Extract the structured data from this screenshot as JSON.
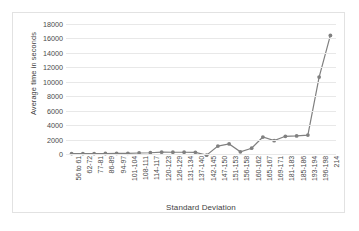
{
  "chart_data": {
    "type": "line",
    "title": "",
    "xlabel": "Standard Deviation",
    "ylabel": "Average time in seconds",
    "ylim": [
      0,
      18000
    ],
    "ytick_step": 2000,
    "yticks": [
      0,
      2000,
      4000,
      6000,
      8000,
      10000,
      12000,
      14000,
      16000,
      18000
    ],
    "grid": true,
    "legend": "none",
    "series_color": "#808080",
    "marker": "circle",
    "categories": [
      "56 to 61",
      "62-72",
      "77-81",
      "86-89",
      "94-97",
      "101-104",
      "108-111",
      "114-117",
      "120-123",
      "126-129",
      "131-134",
      "137-140",
      "142-145",
      "147-150",
      "151-153",
      "156-158",
      "160-162",
      "165-167",
      "169-171",
      "181-183",
      "185-186",
      "193-194",
      "196-198",
      "214"
    ],
    "series": [
      {
        "name": "Average time in seconds",
        "values": [
          60,
          60,
          60,
          70,
          80,
          100,
          140,
          170,
          250,
          240,
          240,
          230,
          -160,
          1100,
          1400,
          300,
          800,
          2350,
          1850,
          2450,
          2500,
          2620,
          10650,
          16420
        ]
      }
    ]
  }
}
